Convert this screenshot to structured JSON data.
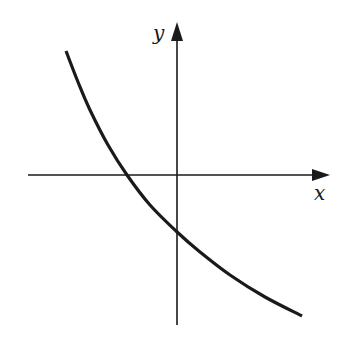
{
  "chart_data": {
    "type": "line",
    "title": "",
    "xlabel": "x",
    "ylabel": "y",
    "grid": false,
    "legend": null,
    "ticks": {
      "x": [],
      "y": []
    },
    "series": [
      {
        "name": "curve",
        "shape": "decreasing, concave up",
        "x_intercept": "negative",
        "y_intercept": "negative",
        "points_px": [
          [
            66,
            51
          ],
          [
            78,
            82
          ],
          [
            90,
            110
          ],
          [
            108,
            145
          ],
          [
            127,
            175
          ],
          [
            150,
            205
          ],
          [
            176,
            231
          ],
          [
            200,
            252
          ],
          [
            230,
            275
          ],
          [
            265,
            297
          ],
          [
            302,
            316
          ]
        ]
      }
    ],
    "axes": {
      "origin_px": [
        177,
        175
      ],
      "x_axis": {
        "from_px": 28,
        "to_px": 330,
        "arrow": true
      },
      "y_axis": {
        "from_px": 325,
        "to_px": 22,
        "arrow": true
      }
    },
    "colors": {
      "line": "#1a1a1a",
      "background": "#ffffff"
    }
  },
  "labels": {
    "x": "x",
    "y": "y"
  }
}
